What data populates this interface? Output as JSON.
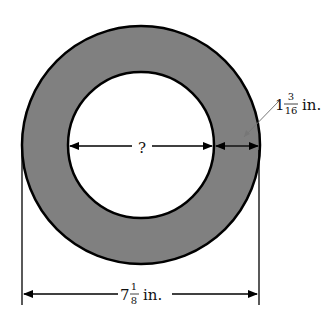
{
  "diagram": {
    "type": "annulus-dimension",
    "colors": {
      "ring_fill": "#808080",
      "stroke": "#000000",
      "background": "#ffffff"
    },
    "outer_diameter": {
      "whole": "7",
      "num": "1",
      "den": "8",
      "unit": "in."
    },
    "ring_width": {
      "whole": "1",
      "num": "3",
      "den": "16",
      "unit": "in."
    },
    "inner_diameter": {
      "label": "?"
    }
  }
}
